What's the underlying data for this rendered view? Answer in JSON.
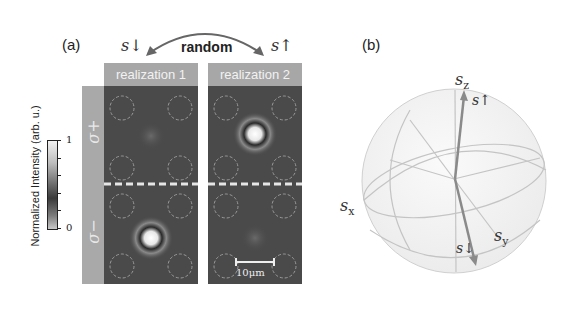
{
  "figure": {
    "panel_a": {
      "label": "(a)",
      "top_labels": {
        "left_state": "s↓",
        "right_state": "s↑",
        "arrow_label": "random"
      },
      "columns": [
        {
          "header": "realization 1",
          "spot_row": "bottom"
        },
        {
          "header": "realization 2",
          "spot_row": "top"
        }
      ],
      "rows": [
        {
          "label": "σ+"
        },
        {
          "label": "σ−"
        }
      ],
      "colorbar": {
        "label": "Normalized Intensity (arb. u.)",
        "max_label": "1",
        "min_label": "0",
        "ticks": 5
      },
      "scale_bar": {
        "label": "10μm"
      }
    },
    "panel_b": {
      "label": "(b)",
      "axes": {
        "z": "s_z",
        "x": "s_x",
        "y": "s_y"
      },
      "vectors": {
        "up": "s↑",
        "down": "s↓"
      },
      "axis_subscripts": {
        "z": "z",
        "x": "x",
        "y": "y"
      },
      "base": "s"
    },
    "colors": {
      "panel_dark": "#4a4a4a",
      "header_gray": "#a7a7a7",
      "side_gray": "#a9a9a9",
      "sphere_line": "#c8c8c8",
      "vector": "#8a8a8a"
    }
  }
}
